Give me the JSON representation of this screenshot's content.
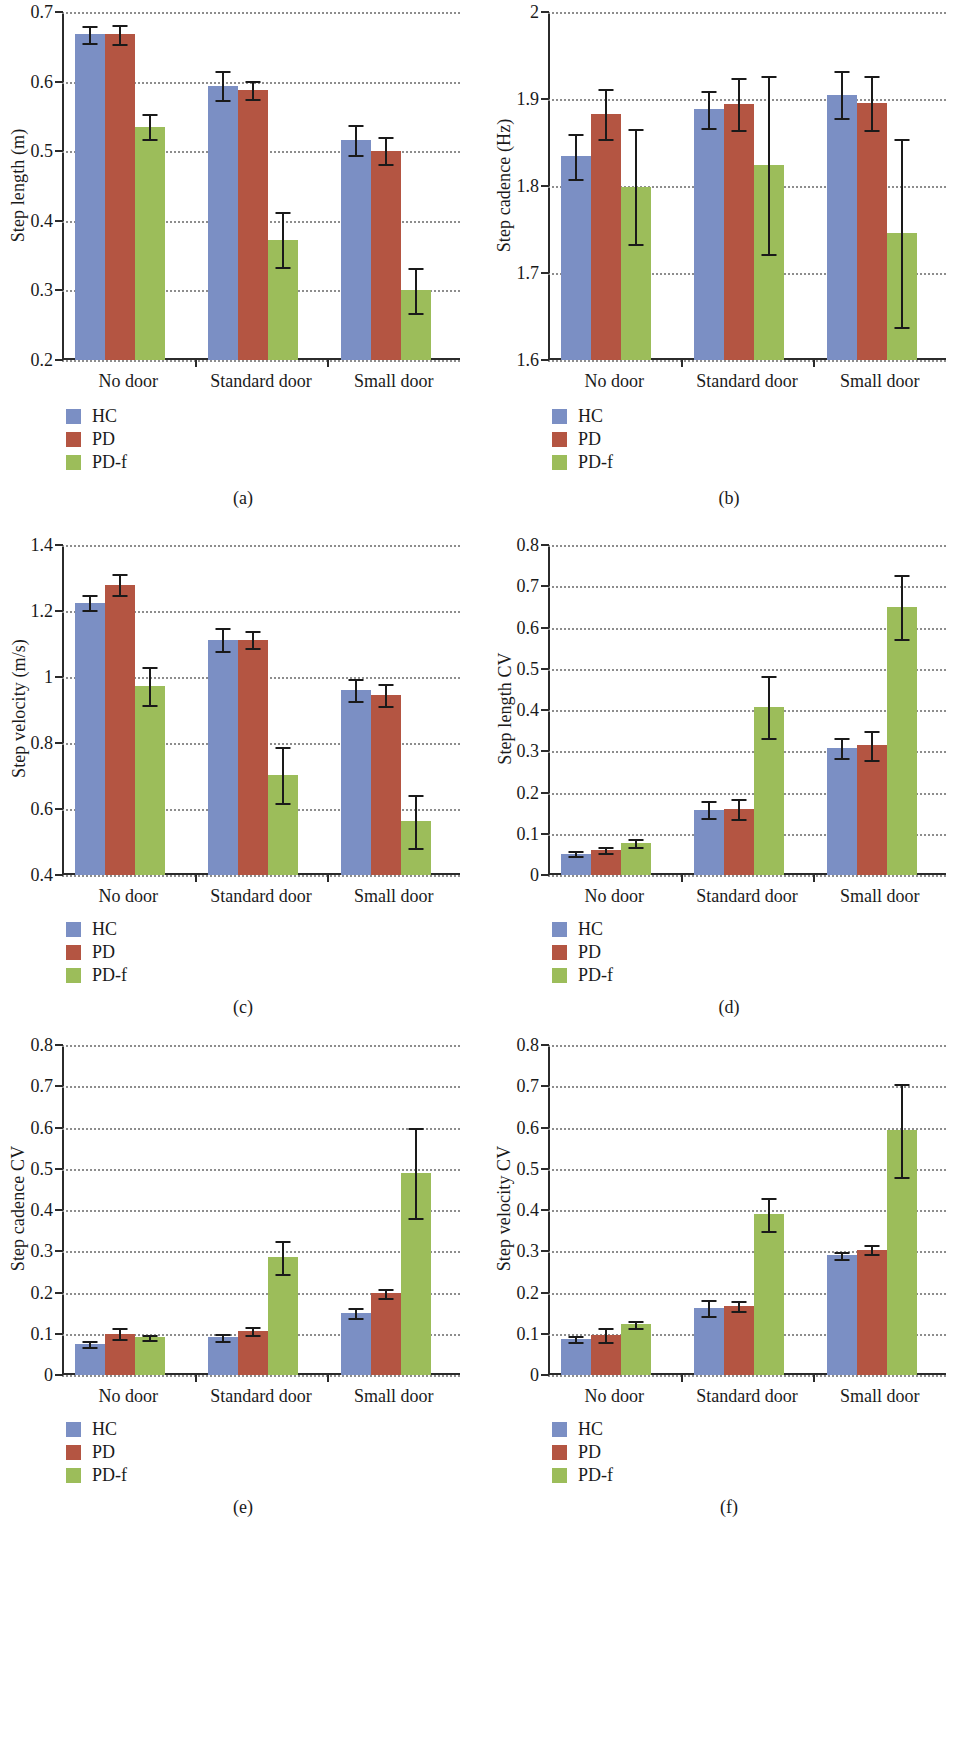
{
  "figure": {
    "series_names": [
      "HC",
      "PD",
      "PD-f"
    ],
    "colors": {
      "HC": "#7b8fc4",
      "PD": "#b45542",
      "PD-f": "#9cbd5a"
    },
    "categories": [
      "No door",
      "Standard door",
      "Small door"
    ]
  },
  "legend": {
    "hc": "HC",
    "pd": "PD",
    "pdf": "PD-f"
  },
  "captions": {
    "a": "(a)",
    "b": "(b)",
    "c": "(c)",
    "d": "(d)",
    "e": "(e)",
    "f": "(f)"
  },
  "chart_data": [
    {
      "panel": "(a)",
      "type": "bar",
      "title": "",
      "xlabel": "",
      "ylabel": "Step length (m)",
      "ylim": [
        0.2,
        0.7
      ],
      "yticks": [
        0.2,
        0.3,
        0.4,
        0.5,
        0.6,
        0.7
      ],
      "ytick_labels": [
        "0.2",
        "0.3",
        "0.4",
        "0.5",
        "0.6",
        "0.7"
      ],
      "grid": true,
      "legend_position": "below-left",
      "categories": [
        "No door",
        "Standard door",
        "Small door"
      ],
      "series": [
        {
          "name": "HC",
          "values": [
            0.668,
            0.594,
            0.516
          ],
          "errors": [
            0.012,
            0.021,
            0.022
          ]
        },
        {
          "name": "PD",
          "values": [
            0.668,
            0.588,
            0.501
          ],
          "errors": [
            0.014,
            0.013,
            0.019
          ]
        },
        {
          "name": "PD-f",
          "values": [
            0.535,
            0.373,
            0.3
          ],
          "errors": [
            0.018,
            0.039,
            0.032
          ]
        }
      ]
    },
    {
      "panel": "(b)",
      "type": "bar",
      "title": "",
      "xlabel": "",
      "ylabel": "Step cadence (Hz)",
      "ylim": [
        1.6,
        2.0
      ],
      "yticks": [
        1.6,
        1.7,
        1.8,
        1.9,
        2.0
      ],
      "ytick_labels": [
        "1.6",
        "1.7",
        "1.8",
        "1.9",
        "2"
      ],
      "grid": true,
      "legend_position": "below-left",
      "categories": [
        "No door",
        "Standard door",
        "Small door"
      ],
      "series": [
        {
          "name": "HC",
          "values": [
            1.834,
            1.888,
            1.905
          ],
          "errors": [
            0.026,
            0.021,
            0.027
          ]
        },
        {
          "name": "PD",
          "values": [
            1.883,
            1.894,
            1.895
          ],
          "errors": [
            0.029,
            0.03,
            0.031
          ]
        },
        {
          "name": "PD-f",
          "values": [
            1.799,
            1.824,
            1.746
          ],
          "errors": [
            0.066,
            0.102,
            0.108
          ]
        }
      ]
    },
    {
      "panel": "(c)",
      "type": "bar",
      "title": "",
      "xlabel": "",
      "ylabel": "Step velocity (m/s)",
      "ylim": [
        0.4,
        1.4
      ],
      "yticks": [
        0.4,
        0.6,
        0.8,
        1.0,
        1.2,
        1.4
      ],
      "ytick_labels": [
        "0.4",
        "0.6",
        "0.8",
        "1",
        "1.2",
        "1.4"
      ],
      "grid": true,
      "legend_position": "below-left",
      "categories": [
        "No door",
        "Standard door",
        "Small door"
      ],
      "series": [
        {
          "name": "HC",
          "values": [
            1.225,
            1.113,
            0.96
          ],
          "errors": [
            0.022,
            0.035,
            0.033
          ]
        },
        {
          "name": "PD",
          "values": [
            1.28,
            1.113,
            0.945
          ],
          "errors": [
            0.032,
            0.026,
            0.034
          ]
        },
        {
          "name": "PD-f",
          "values": [
            0.972,
            0.703,
            0.563
          ],
          "errors": [
            0.058,
            0.085,
            0.08
          ]
        }
      ]
    },
    {
      "panel": "(d)",
      "type": "bar",
      "title": "",
      "xlabel": "",
      "ylabel": "Step length CV",
      "ylim": [
        0,
        0.8
      ],
      "yticks": [
        0,
        0.1,
        0.2,
        0.3,
        0.4,
        0.5,
        0.6,
        0.7,
        0.8
      ],
      "ytick_labels": [
        "0",
        "0.1",
        "0.2",
        "0.3",
        "0.4",
        "0.5",
        "0.6",
        "0.7",
        "0.8"
      ],
      "grid": true,
      "legend_position": "below-left",
      "categories": [
        "No door",
        "Standard door",
        "Small door"
      ],
      "series": [
        {
          "name": "HC",
          "values": [
            0.052,
            0.158,
            0.308
          ],
          "errors": [
            0.005,
            0.021,
            0.024
          ]
        },
        {
          "name": "PD",
          "values": [
            0.06,
            0.16,
            0.315
          ],
          "errors": [
            0.007,
            0.025,
            0.035
          ]
        },
        {
          "name": "PD-f",
          "values": [
            0.078,
            0.407,
            0.65
          ],
          "errors": [
            0.009,
            0.076,
            0.078
          ]
        }
      ]
    },
    {
      "panel": "(e)",
      "type": "bar",
      "title": "",
      "xlabel": "",
      "ylabel": "Step cadence CV",
      "ylim": [
        0,
        0.8
      ],
      "yticks": [
        0,
        0.1,
        0.2,
        0.3,
        0.4,
        0.5,
        0.6,
        0.7,
        0.8
      ],
      "ytick_labels": [
        "0",
        "0.1",
        "0.2",
        "0.3",
        "0.4",
        "0.5",
        "0.6",
        "0.7",
        "0.8"
      ],
      "grid": true,
      "legend_position": "below-left",
      "categories": [
        "No door",
        "Standard door",
        "Small door"
      ],
      "series": [
        {
          "name": "HC",
          "values": [
            0.075,
            0.091,
            0.151
          ],
          "errors": [
            0.008,
            0.008,
            0.012
          ]
        },
        {
          "name": "PD",
          "values": [
            0.1,
            0.107,
            0.198
          ],
          "errors": [
            0.013,
            0.01,
            0.011
          ]
        },
        {
          "name": "PD-f",
          "values": [
            0.091,
            0.285,
            0.49
          ],
          "errors": [
            0.006,
            0.04,
            0.11
          ]
        }
      ]
    },
    {
      "panel": "(f)",
      "type": "bar",
      "title": "",
      "xlabel": "",
      "ylabel": "Step velocity CV",
      "ylim": [
        0,
        0.8
      ],
      "yticks": [
        0,
        0.1,
        0.2,
        0.3,
        0.4,
        0.5,
        0.6,
        0.7,
        0.8
      ],
      "ytick_labels": [
        "0",
        "0.1",
        "0.2",
        "0.3",
        "0.4",
        "0.5",
        "0.6",
        "0.7",
        "0.8"
      ],
      "grid": true,
      "legend_position": "below-left",
      "categories": [
        "No door",
        "Standard door",
        "Small door"
      ],
      "series": [
        {
          "name": "HC",
          "values": [
            0.087,
            0.162,
            0.29
          ],
          "errors": [
            0.008,
            0.019,
            0.009
          ]
        },
        {
          "name": "PD",
          "values": [
            0.097,
            0.167,
            0.304
          ],
          "errors": [
            0.016,
            0.012,
            0.01
          ]
        },
        {
          "name": "PD-f",
          "values": [
            0.123,
            0.39,
            0.593
          ],
          "errors": [
            0.009,
            0.04,
            0.112
          ]
        }
      ]
    }
  ]
}
